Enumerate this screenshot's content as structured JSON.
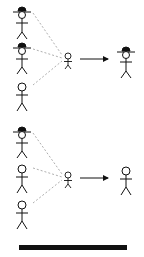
{
  "diagram": {
    "colors": {
      "stroke": "#111111",
      "dashed": "#999999",
      "background": "#ffffff",
      "bar": "#111111"
    },
    "panels": [
      {
        "id": "top",
        "sources": [
          {
            "hat": true
          },
          {
            "hat": true
          },
          {
            "hat": false
          }
        ],
        "child": {
          "size": "small"
        },
        "result": {
          "hat": true
        }
      },
      {
        "id": "bottom",
        "sources": [
          {
            "hat": true
          },
          {
            "hat": false
          },
          {
            "hat": false
          }
        ],
        "child": {
          "size": "small"
        },
        "result": {
          "hat": false
        }
      }
    ]
  }
}
